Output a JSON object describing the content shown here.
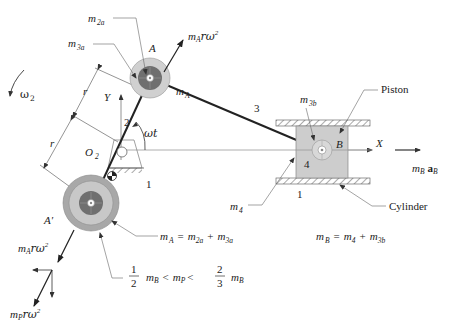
{
  "diagram": {
    "colors": {
      "outer_disc": "#cfcfcf",
      "inner_disc": "#6f6f6f",
      "counterweight_outer": "#a9a9a9",
      "counterweight_mid": "#c8c8c8",
      "piston_fill": "#cdcdcd",
      "piston_border": "#888888",
      "link": "#222222",
      "leader_line": "#666666"
    },
    "labels": {
      "m2a": "m",
      "m2a_sub": "2a",
      "m3a": "m",
      "m3a_sub": "3a",
      "mA_force": "m",
      "mA_force_sub": "A",
      "mA_force_rest": "rω",
      "mA_force_sup": "2",
      "point_A": "A",
      "mA": "m",
      "mA_sub": "A",
      "omega2": "ω",
      "omega2_sub": "2",
      "r_upper": "r",
      "r_lower": "r",
      "axis_Y": "Y",
      "link_2": "2",
      "omega_t": "ωt",
      "O2": "O",
      "O2_sub": "2",
      "ground_1_left": "1",
      "link_3": "3",
      "m3b": "m",
      "m3b_sub": "3b",
      "piston": "Piston",
      "point_B": "B",
      "axis_X": "X",
      "link_4": "4",
      "m4": "m",
      "m4_sub": "4",
      "ground_1_right": "1",
      "cylinder": "Cylinder",
      "mB_aB": "m",
      "mB_aB_sub": "B",
      "aB": "a",
      "aB_sub": "B",
      "point_A_prime": "A′",
      "mA_force_lower": "m",
      "mA_force_lower_sub": "A",
      "mA_force_lower_rest": "rω",
      "mA_force_lower_sup": "2",
      "mP_force": "m",
      "mP_force_sub": "P",
      "mP_force_rest": "rω",
      "mP_force_sup": "2"
    },
    "equations": {
      "mA_eq": {
        "lhs": "m",
        "lhs_sub": "A",
        "eq": "=",
        "t1": "m",
        "t1_sub": "2a",
        "plus": "+",
        "t2": "m",
        "t2_sub": "3a"
      },
      "mB_eq": {
        "lhs": "m",
        "lhs_sub": "B",
        "eq": "=",
        "t1": "m",
        "t1_sub": "4",
        "plus": "+",
        "t2": "m",
        "t2_sub": "3b"
      },
      "mP_range": {
        "f1_num": "1",
        "f1_den": "2",
        "m1": "m",
        "m1_sub": "B",
        "lt1": "<",
        "mid": "m",
        "mid_sub": "P",
        "lt2": "<",
        "f2_num": "2",
        "f2_den": "3",
        "m2": "m",
        "m2_sub": "B"
      }
    }
  }
}
